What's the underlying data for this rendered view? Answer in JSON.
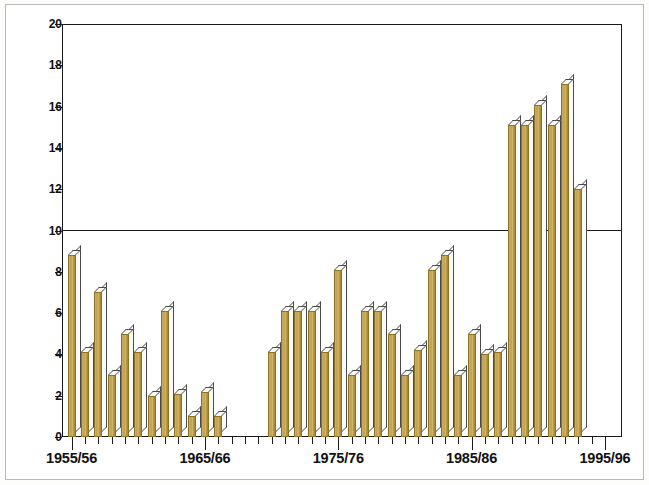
{
  "chart_data": {
    "type": "bar",
    "title": "",
    "subtitle": "",
    "xlabel": "",
    "ylabel": "",
    "ylim": [
      0,
      20
    ],
    "ytick_step": 2,
    "ytick_labels": [
      "0",
      "2",
      "4",
      "6",
      "8",
      "10",
      "12",
      "14",
      "16",
      "18",
      "20"
    ],
    "grid": "single horizontal line at y = 10",
    "gridline_values": [
      10
    ],
    "legend": "none",
    "legend_position": "none",
    "bar_style": "3d-shaded gold bars with white top and right faces",
    "xtick_major_labels": [
      "1955/56",
      "1965/66",
      "1975/76",
      "1985/86",
      "1995/96"
    ],
    "categories": [
      "1955/56",
      "1956/57",
      "1957/58",
      "1958/59",
      "1959/60",
      "1960/61",
      "1961/62",
      "1962/63",
      "1963/64",
      "1964/65",
      "1965/66",
      "1966/67",
      "1967/68",
      "1968/69",
      "1969/70",
      "1970/71",
      "1971/72",
      "1972/73",
      "1973/74",
      "1974/75",
      "1975/76",
      "1976/77",
      "1977/78",
      "1978/79",
      "1979/80",
      "1980/81",
      "1981/82",
      "1982/83",
      "1983/84",
      "1984/85",
      "1985/86",
      "1986/87",
      "1987/88",
      "1988/89",
      "1989/90",
      "1990/91",
      "1991/92",
      "1992/93",
      "1993/94",
      "1994/95",
      "1995/96"
    ],
    "values": [
      8.8,
      4.1,
      7.0,
      3.0,
      5.0,
      4.1,
      2.0,
      6.1,
      2.1,
      1.0,
      2.2,
      1.0,
      null,
      null,
      null,
      4.1,
      6.1,
      6.1,
      6.1,
      4.1,
      8.1,
      3.0,
      6.1,
      6.1,
      5.0,
      3.0,
      4.2,
      8.1,
      8.8,
      3.0,
      5.0,
      4.0,
      4.1,
      15.1,
      15.1,
      16.1,
      15.1,
      17.1,
      12.0,
      null,
      null
    ],
    "missing_note": "no bars plotted for 1967/68, 1968/69, 1969/70, 1994/95 and 1995/96",
    "colors": {
      "bar_fill": "#c5a551",
      "bar_outline": "#8d7226",
      "bar_highlight": "#fbfbf8",
      "axis": "#1a1a1a",
      "plot_background": "#ffffff",
      "page_background": "#fdfdfb",
      "frame": "#b9b9b9"
    }
  }
}
